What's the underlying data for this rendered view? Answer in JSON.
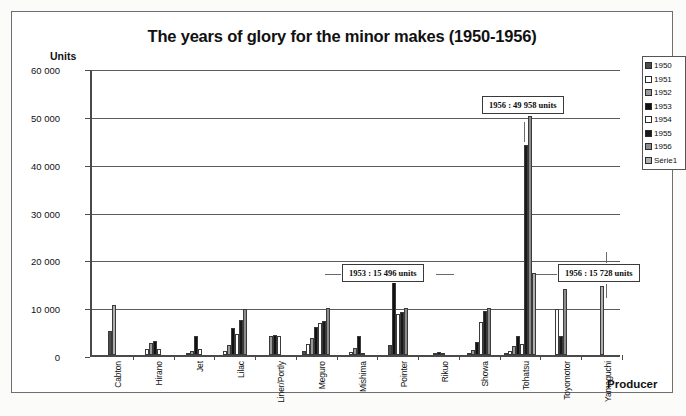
{
  "chart_data": {
    "type": "bar",
    "title": "The years of glory for the minor makes (1950-1956)",
    "xlabel": "Producer",
    "ylabel": "Units",
    "ylim": [
      0,
      60000
    ],
    "ytick_values": [
      0,
      10000,
      20000,
      30000,
      40000,
      50000,
      60000
    ],
    "ytick_labels": [
      "0",
      "10 000",
      "20 000",
      "30 000",
      "40 000",
      "50 000",
      "60 000"
    ],
    "grid": true,
    "legend_position": "right",
    "categories": [
      "Cabton",
      "Hirano",
      "Jet",
      "Lilac",
      "Liner/Portly",
      "Meguro",
      "Mishima",
      "Pointer",
      "Rikuo",
      "Showa",
      "Tohatsu",
      "Toyomotor",
      "Yamaguchi"
    ],
    "series": [
      {
        "name": "1950",
        "color": "#4d4d4d",
        "values": [
          5100,
          0,
          0,
          0,
          0,
          900,
          0,
          2100,
          0,
          0,
          500,
          0,
          0
        ]
      },
      {
        "name": "1951",
        "color": "#ffffff",
        "values": [
          0,
          1300,
          300,
          800,
          0,
          2200,
          600,
          0,
          0,
          400,
          900,
          0,
          0
        ]
      },
      {
        "name": "1952",
        "color": "#9a9a9a",
        "values": [
          0,
          2600,
          900,
          2000,
          3900,
          3600,
          1500,
          0,
          200,
          1100,
          1800,
          0,
          0
        ]
      },
      {
        "name": "1953",
        "color": "#111111",
        "values": [
          0,
          2900,
          4000,
          5700,
          4200,
          5900,
          3900,
          15496,
          700,
          2800,
          4000,
          0,
          0
        ]
      },
      {
        "name": "1954",
        "color": "#fdfdfd",
        "values": [
          0,
          1200,
          1300,
          4400,
          4000,
          6600,
          500,
          8500,
          400,
          6800,
          2200,
          9700,
          0
        ]
      },
      {
        "name": "1955",
        "color": "#1a1a1a",
        "values": [
          0,
          0,
          0,
          7400,
          0,
          7100,
          0,
          9000,
          0,
          9200,
          44000,
          4000,
          0
        ]
      },
      {
        "name": "1956",
        "color": "#8d8d8d",
        "values": [
          0,
          0,
          0,
          9600,
          0,
          9900,
          0,
          9800,
          0,
          9800,
          49958,
          13800,
          0
        ]
      },
      {
        "name": "Série1",
        "color": "#b0b0b0",
        "values": [
          10400,
          0,
          0,
          0,
          0,
          0,
          0,
          0,
          0,
          0,
          17100,
          0,
          14500
        ]
      }
    ],
    "annotations": [
      {
        "id": "tohatsu",
        "text": "1956 : 49 958 units"
      },
      {
        "id": "pointer",
        "text": "1953 : 15 496 units"
      },
      {
        "id": "toyomotor",
        "text": "1956 : 15 728 units"
      }
    ]
  },
  "legend": {
    "items": [
      {
        "label": "1950",
        "swatch_class": "s1950"
      },
      {
        "label": "1951",
        "swatch_class": "s1951"
      },
      {
        "label": "1952",
        "swatch_class": "s1952"
      },
      {
        "label": "1953",
        "swatch_class": "s1953"
      },
      {
        "label": "1954",
        "swatch_class": "s1954"
      },
      {
        "label": "1955",
        "swatch_class": "s1955"
      },
      {
        "label": "1956",
        "swatch_class": "s1956"
      },
      {
        "label": "Série1",
        "swatch_class": "sSerie"
      }
    ]
  }
}
